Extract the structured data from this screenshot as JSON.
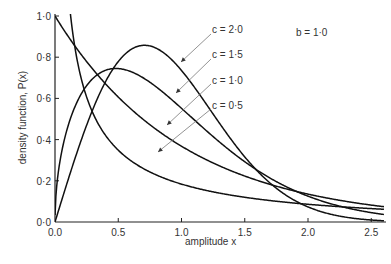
{
  "chart_data": {
    "type": "line",
    "title": "",
    "xlabel": "amplitude x",
    "ylabel": "density function, P(x)",
    "xlim": [
      0,
      2.6
    ],
    "ylim": [
      0,
      1.0
    ],
    "xticks": [
      "0.0",
      "0.5",
      "1.0",
      "1.5",
      "2.0",
      "2.5"
    ],
    "yticks": [
      "0·0",
      "0·2",
      "0·4",
      "0·6",
      "0·8",
      "1·0"
    ],
    "grid": false,
    "annotation": "b = 1·0",
    "function": "Weibull: P(x) = (c/b)(x/b)^(c-1) exp(-(x/b)^c)",
    "series": [
      {
        "name": "c = 2·0",
        "c": 2.0,
        "x": [
          0,
          0.25,
          0.5,
          0.707,
          1.0,
          1.5,
          2.0,
          2.5
        ],
        "values": [
          0,
          0.47,
          0.78,
          0.86,
          0.74,
          0.32,
          0.07,
          0.01
        ]
      },
      {
        "name": "c = 1·5",
        "c": 1.5,
        "x": [
          0,
          0.25,
          0.48,
          0.75,
          1.0,
          1.5,
          2.0,
          2.5
        ],
        "values": [
          0,
          0.66,
          0.74,
          0.68,
          0.55,
          0.29,
          0.13,
          0.05
        ]
      },
      {
        "name": "c = 1·0",
        "c": 1.0,
        "x": [
          0,
          0.5,
          1.0,
          1.5,
          2.0,
          2.5
        ],
        "values": [
          1.0,
          0.61,
          0.37,
          0.22,
          0.14,
          0.08
        ]
      },
      {
        "name": "c = 0·5",
        "c": 0.5,
        "x": [
          0.13,
          0.25,
          0.5,
          1.0,
          1.5,
          2.0,
          2.5
        ],
        "values": [
          1.0,
          0.61,
          0.35,
          0.18,
          0.12,
          0.09,
          0.07
        ]
      }
    ]
  }
}
